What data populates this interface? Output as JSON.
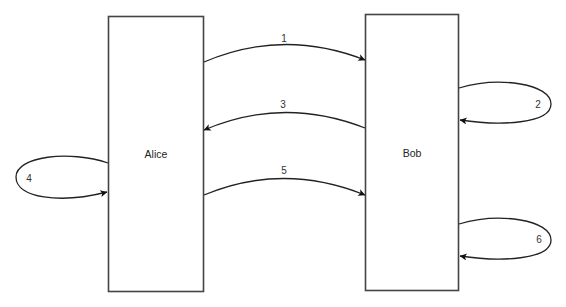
{
  "diagram": {
    "type": "sequence-state-diagram",
    "actors": [
      {
        "id": "alice",
        "label": "Alice"
      },
      {
        "id": "bob",
        "label": "Bob"
      }
    ],
    "messages": [
      {
        "label": "1",
        "from": "Alice",
        "to": "Bob"
      },
      {
        "label": "2",
        "from": "Bob",
        "to": "Bob"
      },
      {
        "label": "3",
        "from": "Bob",
        "to": "Alice"
      },
      {
        "label": "4",
        "from": "Alice",
        "to": "Alice"
      },
      {
        "label": "5",
        "from": "Alice",
        "to": "Bob"
      },
      {
        "label": "6",
        "from": "Bob",
        "to": "Bob"
      }
    ],
    "colors": {
      "background": "#ffffff",
      "stroke": "#444444",
      "text": "#222222"
    }
  }
}
